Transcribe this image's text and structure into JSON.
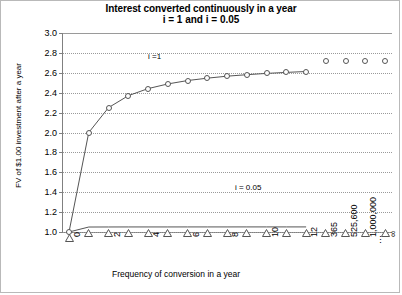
{
  "chart_data": {
    "type": "line",
    "title": "Interest converted continuously in a year",
    "subtitle": "i = 1 and i = 0.05",
    "xlabel": "Frequency of conversion in a year",
    "ylabel": "FV of $1.00 investment after a year",
    "ylim": [
      1.0,
      3.0
    ],
    "ytick_labels": [
      "3.0",
      "2.8",
      "2.6",
      "2.4",
      "2.2",
      "2.0",
      "1.8",
      "1.6",
      "1.4",
      "1.2",
      "1.0"
    ],
    "ytick_values": [
      3.0,
      2.8,
      2.6,
      2.4,
      2.2,
      2.0,
      1.8,
      1.6,
      1.4,
      1.2,
      1.0
    ],
    "grid": true,
    "legend": "inline-annotations",
    "categories": [
      "0",
      "1",
      "2",
      "3",
      "4",
      "5",
      "6",
      "7",
      "8",
      "9",
      "10",
      "11",
      "12",
      "365",
      "525,600",
      "1,000,000",
      "∞"
    ],
    "xtick_labels": [
      "0",
      "",
      "2",
      "",
      "4",
      "",
      "6",
      "",
      "8",
      "",
      "10",
      "",
      "12",
      "365",
      "525,600",
      "1,000,000",
      "∞"
    ],
    "series": [
      {
        "name": "i = 1",
        "label": "i =1",
        "marker": "circle",
        "connected_upto_index": 12,
        "values": [
          1.0,
          2.0,
          2.25,
          2.37,
          2.441,
          2.488,
          2.522,
          2.546,
          2.566,
          2.581,
          2.594,
          2.604,
          2.613,
          2.715,
          2.718,
          2.718,
          2.718
        ]
      },
      {
        "name": "i = 0.05",
        "label": "i = 0.05",
        "marker": "triangle",
        "connected_upto_index": 12,
        "values": [
          1.0,
          1.05,
          1.0506,
          1.0508,
          1.0509,
          1.0509,
          1.051,
          1.051,
          1.051,
          1.0511,
          1.0511,
          1.0511,
          1.0511,
          1.0513,
          1.0513,
          1.0513,
          1.0513
        ]
      }
    ],
    "annotations": [
      {
        "text": "i =1",
        "x_index": 4,
        "y": 2.76
      },
      {
        "text": "i = 0.05",
        "x_index": 8.4,
        "y": 1.44
      }
    ]
  }
}
